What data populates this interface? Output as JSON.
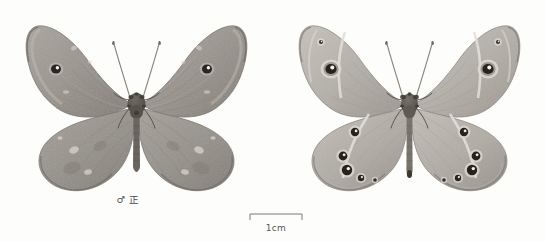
{
  "plate": {
    "background_color": "#fdfdfc",
    "specimens": [
      {
        "id": "dorsal",
        "caption": "♂ 正",
        "sex_symbol": "♂",
        "aspect_label": "正",
        "view": "dorsal",
        "wing_color": "#9a958e",
        "wing_color_light": "#bdb8b1",
        "wing_color_dark": "#7d7871",
        "wing_edge_color": "#6e6962",
        "body_color": "#6b665f",
        "ocellus_ring_color": "#2a2724",
        "ocellus_pupil_color": "#f4f2ee",
        "forewing_ocelli": 1,
        "hindwing_ocelli": 0
      },
      {
        "id": "ventral",
        "caption": "♂ 反",
        "sex_symbol": "♂",
        "aspect_label": "反",
        "view": "ventral",
        "wing_color": "#b4b0a9",
        "wing_color_light": "#cfcbc5",
        "wing_color_dark": "#9c978f",
        "wing_edge_color": "#827d76",
        "body_color": "#6b665f",
        "ocellus_ring_color": "#26231f",
        "ocellus_pupil_color": "#f6f4f0",
        "ocellus_halo_color": "#ded9d0",
        "forewing_ocelli": 2,
        "hindwing_ocelli": 5
      }
    ]
  },
  "scalebar": {
    "label": "1cm",
    "length_px": 54,
    "line_color": "#7a7a7a",
    "tick_side": "down"
  }
}
